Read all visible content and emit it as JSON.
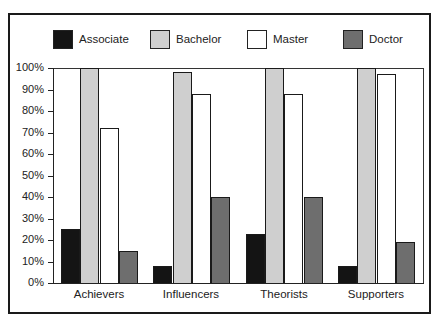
{
  "chart_data": {
    "type": "bar",
    "title": "",
    "xlabel": "",
    "ylabel": "",
    "ylim": [
      0,
      100
    ],
    "y_tick_labels": [
      "0%",
      "10%",
      "20%",
      "30%",
      "40%",
      "50%",
      "60%",
      "70%",
      "80%",
      "90%",
      "100%"
    ],
    "categories": [
      "Achievers",
      "Influencers",
      "Theorists",
      "Supporters"
    ],
    "series": [
      {
        "name": "Associate",
        "color": "#141414",
        "values": [
          25,
          8,
          23,
          8
        ]
      },
      {
        "name": "Bachelor",
        "color": "#cfcfcf",
        "values": [
          100,
          98,
          100,
          100
        ]
      },
      {
        "name": "Master",
        "color": "#ffffff",
        "values": [
          72,
          88,
          88,
          97
        ]
      },
      {
        "name": "Doctor",
        "color": "#6e6e6e",
        "values": [
          15,
          40,
          40,
          19
        ]
      }
    ],
    "legend_position": "top",
    "grid": false
  },
  "legend": {
    "items": [
      {
        "label": "Associate",
        "color": "#141414"
      },
      {
        "label": "Bachelor",
        "color": "#cfcfcf"
      },
      {
        "label": "Master",
        "color": "#ffffff"
      },
      {
        "label": "Doctor",
        "color": "#6e6e6e"
      }
    ]
  }
}
